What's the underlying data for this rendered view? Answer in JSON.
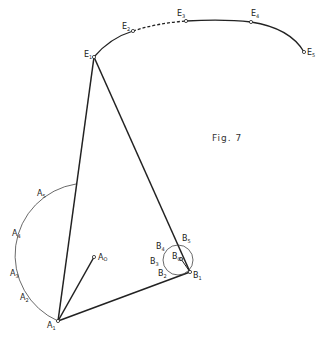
{
  "figure": {
    "caption": "Fig. 7",
    "colors": {
      "ink": "#222222",
      "background": "#ffffff"
    }
  },
  "labels": {
    "E1": {
      "base": "E",
      "sub": "1"
    },
    "E2": {
      "base": "E",
      "sub": "2"
    },
    "E3": {
      "base": "E",
      "sub": "3"
    },
    "E4": {
      "base": "E",
      "sub": "4"
    },
    "E5": {
      "base": "E",
      "sub": "5"
    },
    "A0": {
      "base": "A",
      "sub": "O"
    },
    "A1": {
      "base": "A",
      "sub": "1"
    },
    "A2": {
      "base": "A",
      "sub": "2"
    },
    "A3": {
      "base": "A",
      "sub": "3"
    },
    "A4": {
      "base": "A",
      "sub": "4"
    },
    "A5": {
      "base": "A",
      "sub": "5"
    },
    "B0": {
      "base": "B",
      "sub": "O"
    },
    "B1": {
      "base": "B",
      "sub": "1"
    },
    "B2": {
      "base": "B",
      "sub": "2"
    },
    "B3": {
      "base": "B",
      "sub": "3"
    },
    "B4": {
      "base": "B",
      "sub": "4"
    },
    "B5": {
      "base": "B",
      "sub": "5"
    }
  }
}
